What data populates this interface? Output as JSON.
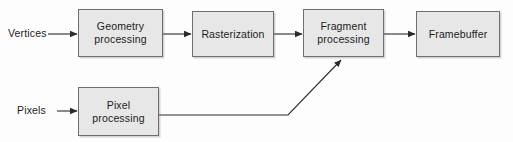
{
  "diagram": {
    "background_color": "#fdfdfd",
    "box_fill_color": "#e7e7e7",
    "box_border_color": "#6f6f6f",
    "line_color": "#3a3a3a",
    "text_color": "#1c1c1c",
    "inputs": [
      {
        "id": "vertices",
        "label": "Vertices"
      },
      {
        "id": "pixels",
        "label": "Pixels"
      }
    ],
    "stages": [
      {
        "id": "geometry",
        "label": "Geometry\nprocessing"
      },
      {
        "id": "rasterization",
        "label": "Rasterization"
      },
      {
        "id": "fragment",
        "label": "Fragment\nprocessing"
      },
      {
        "id": "framebuffer",
        "label": "Framebuffer"
      },
      {
        "id": "pixel",
        "label": "Pixel\nprocessing"
      }
    ],
    "connections": [
      {
        "id": "vertices-to-geometry",
        "from": "vertices",
        "to": "geometry",
        "style": "straight-arrow"
      },
      {
        "id": "geometry-to-rasterization",
        "from": "geometry",
        "to": "rasterization",
        "style": "straight-arrow"
      },
      {
        "id": "rasterization-to-fragment",
        "from": "rasterization",
        "to": "fragment",
        "style": "straight-arrow"
      },
      {
        "id": "fragment-to-framebuffer",
        "from": "fragment",
        "to": "framebuffer",
        "style": "straight-arrow"
      },
      {
        "id": "pixels-to-pixel",
        "from": "pixels",
        "to": "pixel",
        "style": "straight-arrow"
      },
      {
        "id": "pixel-to-fragment",
        "from": "pixel",
        "to": "fragment",
        "style": "elbow-diagonal-arrow"
      }
    ]
  }
}
